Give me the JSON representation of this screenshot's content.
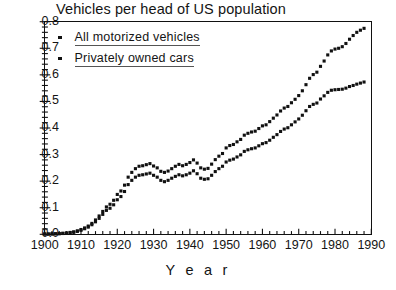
{
  "chart_data": {
    "type": "scatter",
    "title": "Vehicles per head of US population",
    "xlabel": "Y e a r",
    "ylabel": "",
    "xlim": [
      1900,
      1990
    ],
    "ylim": [
      0.0,
      0.8
    ],
    "xticks": [
      1900,
      1910,
      1920,
      1930,
      1940,
      1950,
      1960,
      1970,
      1980,
      1990
    ],
    "yticks": [
      "0.0",
      "0.1",
      "0.2",
      "0.3",
      "0.4",
      "0.5",
      "0.6",
      "0.7",
      "0.8"
    ],
    "minor_tick_interval_x": 2,
    "minor_ticks_per_y_interval": 5,
    "grid": false,
    "legend_position": "top-left",
    "marker": "square",
    "x": [
      1900,
      1901,
      1902,
      1903,
      1904,
      1905,
      1906,
      1907,
      1908,
      1909,
      1910,
      1911,
      1912,
      1913,
      1914,
      1915,
      1916,
      1917,
      1918,
      1919,
      1920,
      1921,
      1922,
      1923,
      1924,
      1925,
      1926,
      1927,
      1928,
      1929,
      1930,
      1931,
      1932,
      1933,
      1934,
      1935,
      1936,
      1937,
      1938,
      1939,
      1940,
      1941,
      1942,
      1943,
      1944,
      1945,
      1946,
      1947,
      1948,
      1949,
      1950,
      1951,
      1952,
      1953,
      1954,
      1955,
      1956,
      1957,
      1958,
      1959,
      1960,
      1961,
      1962,
      1963,
      1964,
      1965,
      1966,
      1967,
      1968,
      1969,
      1970,
      1971,
      1972,
      1973,
      1974,
      1975,
      1976,
      1977,
      1978,
      1979,
      1980,
      1981,
      1982,
      1983,
      1984,
      1985,
      1986,
      1987,
      1988
    ],
    "series": [
      {
        "name": "All motorized vehicles",
        "values": [
          0.001,
          0.001,
          0.002,
          0.002,
          0.003,
          0.004,
          0.005,
          0.007,
          0.009,
          0.013,
          0.018,
          0.024,
          0.031,
          0.041,
          0.054,
          0.069,
          0.086,
          0.103,
          0.113,
          0.128,
          0.15,
          0.163,
          0.185,
          0.215,
          0.233,
          0.247,
          0.256,
          0.258,
          0.262,
          0.266,
          0.257,
          0.25,
          0.237,
          0.233,
          0.238,
          0.247,
          0.256,
          0.263,
          0.258,
          0.263,
          0.27,
          0.28,
          0.268,
          0.25,
          0.245,
          0.248,
          0.264,
          0.281,
          0.294,
          0.304,
          0.325,
          0.334,
          0.338,
          0.348,
          0.357,
          0.373,
          0.38,
          0.385,
          0.388,
          0.398,
          0.408,
          0.412,
          0.424,
          0.437,
          0.449,
          0.464,
          0.475,
          0.481,
          0.495,
          0.508,
          0.522,
          0.54,
          0.563,
          0.587,
          0.601,
          0.61,
          0.632,
          0.652,
          0.675,
          0.69,
          0.697,
          0.7,
          0.706,
          0.718,
          0.734,
          0.748,
          0.76,
          0.768,
          0.775
        ]
      },
      {
        "name": "Privately owned cars",
        "values": [
          0.001,
          0.001,
          0.001,
          0.002,
          0.002,
          0.003,
          0.004,
          0.006,
          0.008,
          0.011,
          0.015,
          0.021,
          0.027,
          0.036,
          0.047,
          0.06,
          0.075,
          0.09,
          0.098,
          0.111,
          0.13,
          0.142,
          0.161,
          0.187,
          0.203,
          0.215,
          0.222,
          0.224,
          0.227,
          0.23,
          0.222,
          0.215,
          0.203,
          0.198,
          0.203,
          0.211,
          0.218,
          0.224,
          0.22,
          0.224,
          0.23,
          0.239,
          0.228,
          0.211,
          0.207,
          0.209,
          0.222,
          0.236,
          0.247,
          0.256,
          0.272,
          0.279,
          0.283,
          0.291,
          0.299,
          0.312,
          0.318,
          0.322,
          0.325,
          0.333,
          0.341,
          0.345,
          0.354,
          0.365,
          0.375,
          0.387,
          0.396,
          0.401,
          0.412,
          0.423,
          0.434,
          0.448,
          0.465,
          0.481,
          0.489,
          0.494,
          0.509,
          0.521,
          0.534,
          0.542,
          0.544,
          0.545,
          0.546,
          0.55,
          0.556,
          0.56,
          0.565,
          0.569,
          0.573
        ]
      }
    ]
  },
  "legend": {
    "items": [
      {
        "label": "All motorized vehicles"
      },
      {
        "label": "Privately owned cars"
      }
    ]
  }
}
